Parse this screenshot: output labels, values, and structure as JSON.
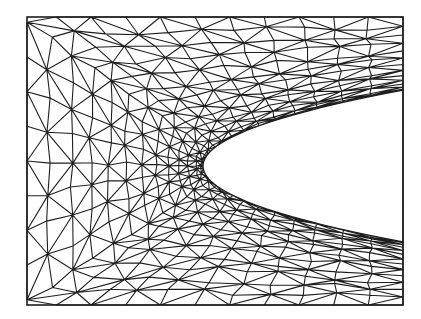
{
  "diagram": {
    "type": "triangular-mesh",
    "frame": {
      "x": 27,
      "y": 17,
      "width": 376,
      "height": 288
    },
    "hole": {
      "shape": "parabola",
      "tip": {
        "x": 203,
        "y": 165
      },
      "right_edge_top_y": 90,
      "right_edge_bottom_y": 242
    },
    "colors": {
      "line": "#1e1e1e",
      "background": "#ffffff",
      "hole_fill": "#ffffff"
    },
    "labels": []
  }
}
